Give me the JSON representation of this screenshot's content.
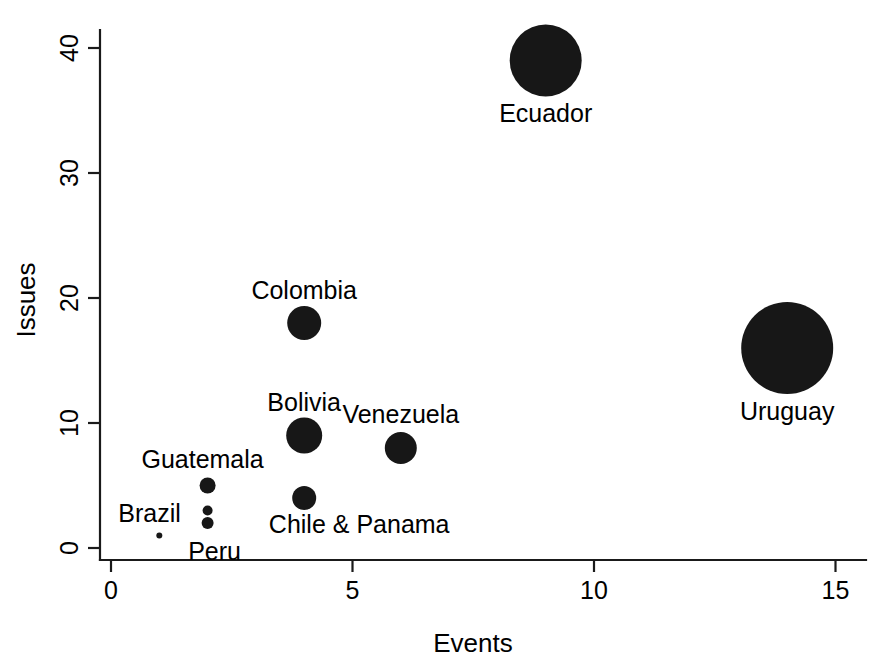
{
  "chart_data": {
    "type": "scatter",
    "title": "",
    "subtitle": "",
    "xlabel": "Events",
    "ylabel": "Issues",
    "xlim": [
      0,
      15.5
    ],
    "ylim": [
      0,
      42
    ],
    "xticks": [
      0,
      5,
      10,
      15
    ],
    "yticks": [
      0,
      10,
      20,
      30,
      40
    ],
    "xtick_labels": [
      "0",
      "5",
      "10",
      "15"
    ],
    "ytick_labels": [
      "0",
      "10",
      "20",
      "30",
      "40"
    ],
    "grid": false,
    "legend": null,
    "marker_color": "#171717",
    "points": [
      {
        "label": "Ecuador",
        "x": 9,
        "y": 39,
        "size": 36,
        "label_dx": 0,
        "label_dy": 52
      },
      {
        "label": "Uruguay",
        "x": 14,
        "y": 16,
        "size": 46,
        "label_dx": 0,
        "label_dy": 63
      },
      {
        "label": "Colombia",
        "x": 4,
        "y": 18,
        "size": 17,
        "label_dx": 0,
        "label_dy": -33
      },
      {
        "label": "Bolivia",
        "x": 4,
        "y": 9,
        "size": 18,
        "label_dx": 0,
        "label_dy": -34
      },
      {
        "label": "Venezuela",
        "x": 6,
        "y": 8,
        "size": 16,
        "label_dx": 0,
        "label_dy": -34
      },
      {
        "label": "Chile & Panama",
        "x": 4,
        "y": 4,
        "size": 12,
        "label_dx": 55,
        "label_dy": 26
      },
      {
        "label": "Guatemala",
        "x": 2,
        "y": 5,
        "size": 8,
        "label_dx": -5,
        "label_dy": -27
      },
      {
        "label": "Brazil",
        "x": 2,
        "y": 3,
        "size": 5,
        "label_dx": -58,
        "label_dy": 2
      },
      {
        "label": "Peru",
        "x": 2,
        "y": 2,
        "size": 6,
        "label_dx": 7,
        "label_dy": 28
      },
      {
        "label": "",
        "x": 1,
        "y": 1,
        "size": 3,
        "label_dx": 0,
        "label_dy": 0
      }
    ]
  },
  "axes": {
    "x_axis_name": "Events",
    "y_axis_name": "Issues"
  }
}
